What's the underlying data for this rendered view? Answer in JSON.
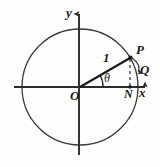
{
  "figure": {
    "background_color": "#fefefe",
    "stroke_color": "#2b2b2b",
    "labels": {
      "y_axis": "y",
      "x_axis": "x",
      "origin": "O",
      "point_p": "P",
      "point_q": "Q",
      "point_n": "N",
      "radius_length": "1",
      "angle": "θ"
    },
    "geometry": {
      "center": [
        80,
        87
      ],
      "radius_px": 58,
      "angle_degrees": 30,
      "point_p": [
        130,
        58
      ],
      "point_n": [
        130,
        87
      ],
      "point_q": [
        138,
        70
      ],
      "x_axis_from": [
        14,
        87
      ],
      "x_axis_to": [
        148,
        87
      ],
      "y_axis_from": [
        79,
        155
      ],
      "y_axis_to": [
        79,
        11
      ]
    },
    "icons": {
      "x_axis_arrow": "arrow-right-icon",
      "y_axis_arrow": "arrow-up-icon",
      "q_arrow": "arrow-down-icon",
      "dashed_drop_line": "dashed-line-icon"
    }
  }
}
